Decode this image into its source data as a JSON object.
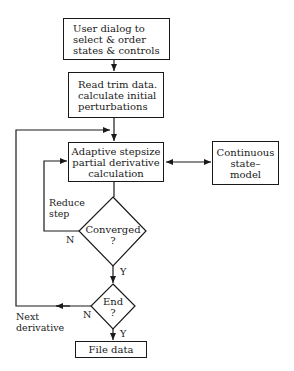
{
  "diagram": {
    "type": "flowchart",
    "nodes": {
      "user_dialog": {
        "label": "User dialog to\nselect & order\nstates & controls"
      },
      "read_trim": {
        "label": "Read trim data.\ncalculate initial\nperturbations"
      },
      "adaptive": {
        "label": "Adaptive stepsize\npartial derivative\ncalculation"
      },
      "continuous": {
        "label": "Continuous\nstate–\nmodel"
      },
      "converged": {
        "label": "Converged\n?"
      },
      "end": {
        "label": "End\n?"
      },
      "file_data": {
        "label": "File data"
      }
    },
    "edge_labels": {
      "reduce_step": "Reduce\nstep",
      "converged_no": "N",
      "converged_yes": "Y",
      "next_derivative": "Next\nderivative",
      "end_no": "N",
      "end_yes": "Y"
    },
    "colors": {
      "line": "#1a1a1a",
      "background": "#ffffff"
    }
  }
}
